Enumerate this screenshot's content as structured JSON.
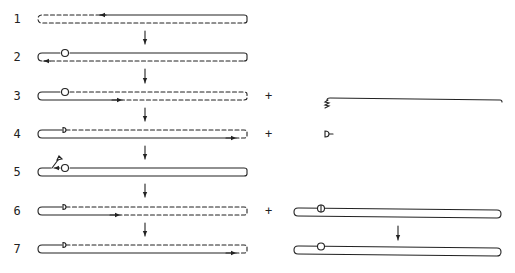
{
  "diagram": {
    "type": "strand-loop process sequence",
    "steps": [
      {
        "label": "1",
        "y": 19,
        "top": "solid-right-half-arrow-left",
        "bottom": "dashed",
        "marker": "none"
      },
      {
        "label": "2",
        "y": 57,
        "top": "solid",
        "bottom": "dashed-arrow-left",
        "marker": "circle"
      },
      {
        "label": "3",
        "y": 96,
        "top": "dashed",
        "bottom": "solid-left-half-arrow-right",
        "marker": "circle"
      },
      {
        "label": "4",
        "y": 134,
        "top": "dashed",
        "bottom": "solid-arrow-right",
        "marker": "half-circle"
      },
      {
        "label": "5",
        "y": 172,
        "top": "solid",
        "bottom": "solid",
        "marker": "circle-with-released-tag"
      },
      {
        "label": "6",
        "y": 211,
        "top": "dashed",
        "bottom": "solid-left-half-arrow-right",
        "marker": "half-circle"
      },
      {
        "label": "7",
        "y": 249,
        "top": "dashed",
        "bottom": "solid-arrow-right",
        "marker": "half-circle"
      }
    ],
    "plus_signs": [
      {
        "row": "3",
        "symbol": "+"
      },
      {
        "row": "4",
        "symbol": "+"
      },
      {
        "row": "6",
        "symbol": "+"
      }
    ],
    "side_items": [
      {
        "row": "3",
        "description": "single strand with zigzag end"
      },
      {
        "row": "4",
        "description": "small half-circle tag"
      },
      {
        "row": "6",
        "description": "closed loop with split circle marker"
      },
      {
        "row": "7",
        "description": "closed loop with circle marker"
      }
    ],
    "colors": {
      "stroke": "#222222",
      "background": "#ffffff"
    }
  }
}
